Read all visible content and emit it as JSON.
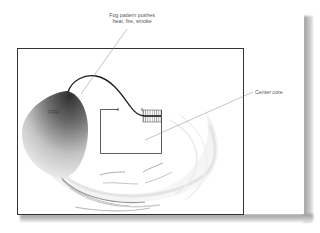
{
  "diagram": {
    "labels": {
      "fog_pattern_line1": "Fog pattern pushes",
      "fog_pattern_line2": "heat, fire, smoke",
      "center_core": "Center core",
      "fire": "FIRE"
    },
    "elements": [
      "room-outline",
      "fire-region",
      "hose-line",
      "stairwell",
      "center-core-box",
      "fog-spray-pattern"
    ],
    "colors": {
      "frame": "#333333",
      "hose": "#1a1a1a",
      "fire_dark": "#3a3a3a",
      "fire_light": "#f2f2f2",
      "shadow": "#a8a8a8",
      "leader": "#888888",
      "text": "#555555"
    }
  }
}
